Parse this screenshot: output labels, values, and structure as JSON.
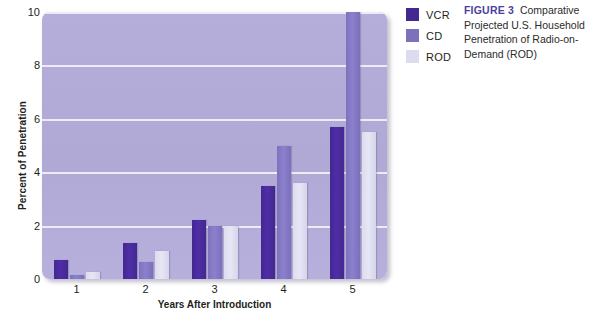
{
  "chart_data": {
    "type": "bar",
    "title": "Comparative Projected U.S. Household Penetration of Radio-on-Demand (ROD)",
    "xlabel": "Years After Introduction",
    "ylabel": "Percent of Penetration",
    "categories": [
      "1",
      "2",
      "3",
      "4",
      "5"
    ],
    "series": [
      {
        "name": "VCR",
        "color": "#43288f",
        "values": [
          0.7,
          1.35,
          2.2,
          3.5,
          5.7
        ]
      },
      {
        "name": "CD",
        "color": "#7d71be",
        "values": [
          0.15,
          0.65,
          2.0,
          5.0,
          10.0
        ]
      },
      {
        "name": "ROD",
        "color": "#dcdcee",
        "values": [
          0.25,
          1.05,
          2.0,
          3.6,
          5.5
        ]
      }
    ],
    "ylim": [
      0,
      10
    ],
    "yticks": [
      0,
      2,
      4,
      6,
      8,
      10
    ],
    "ytick_labels": [
      "0",
      "2",
      "4",
      "6",
      "8",
      "10"
    ],
    "grid": true,
    "legend_position": "right",
    "plot_background": "#b0a9d6"
  },
  "legend": {
    "items": [
      {
        "label": "VCR"
      },
      {
        "label": "CD"
      },
      {
        "label": "ROD"
      }
    ]
  },
  "caption": {
    "figure_label": "FIGURE 3",
    "text": "Comparative Projected U.S. Household Penetration of Radio-on-Demand (ROD)"
  }
}
